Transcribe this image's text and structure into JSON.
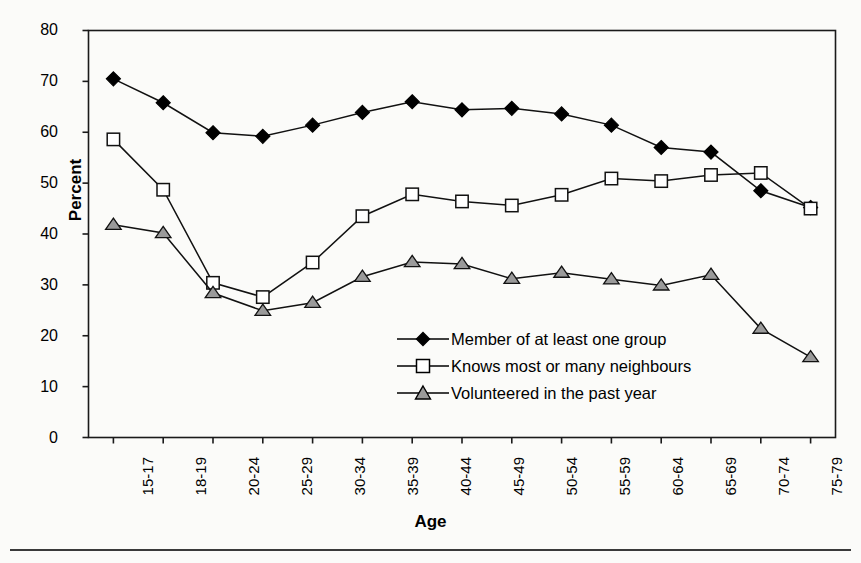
{
  "chart_data": {
    "type": "line",
    "title": "",
    "xlabel": "Age",
    "ylabel": "Percent",
    "ylim": [
      0,
      80
    ],
    "yticks": [
      0,
      10,
      20,
      30,
      40,
      50,
      60,
      70,
      80
    ],
    "grid": false,
    "legend_position": "center-right-inside",
    "categories": [
      "15-17",
      "18-19",
      "20-24",
      "25-29",
      "30-34",
      "35-39",
      "40-44",
      "45-49",
      "50-54",
      "55-59",
      "60-64",
      "65-69",
      "70-74",
      "75-79",
      "80+"
    ],
    "series": [
      {
        "name": "Member of at least one group",
        "marker": "filled-diamond",
        "color": "#000000",
        "values": [
          70.5,
          65.8,
          59.9,
          59.2,
          61.4,
          63.9,
          66.0,
          64.4,
          64.7,
          63.6,
          61.4,
          57.0,
          56.1,
          48.5,
          45.2
        ]
      },
      {
        "name": "Knows most or many neighbours",
        "marker": "open-square",
        "color": "#ffffff",
        "values": [
          58.6,
          48.7,
          30.4,
          27.6,
          34.4,
          43.5,
          47.8,
          46.4,
          45.6,
          47.7,
          50.9,
          50.4,
          51.6,
          52.0,
          45.0
        ]
      },
      {
        "name": "Volunteered in the past year",
        "marker": "grey-triangle",
        "color": "#9a9a9a",
        "values": [
          41.8,
          40.2,
          28.4,
          24.9,
          26.5,
          31.6,
          34.5,
          34.1,
          31.2,
          32.4,
          31.1,
          29.9,
          32.0,
          21.4,
          15.8
        ]
      }
    ]
  },
  "axes": {
    "y_title": "Percent",
    "x_title": "Age",
    "y_tick_labels": [
      "80",
      "70",
      "60",
      "50",
      "40",
      "30",
      "20",
      "10",
      "0"
    ],
    "x_tick_labels": [
      "15-17",
      "18-19",
      "20-24",
      "25-29",
      "30-34",
      "35-39",
      "40-44",
      "45-49",
      "50-54",
      "55-59",
      "60-64",
      "65-69",
      "70-74",
      "75-79",
      "80+"
    ]
  },
  "legend": {
    "items": [
      {
        "label": "Member of at least one group",
        "marker": "filled-diamond"
      },
      {
        "label": "Knows most or many neighbours",
        "marker": "open-square"
      },
      {
        "label": "Volunteered in the past year",
        "marker": "grey-triangle"
      }
    ]
  },
  "colors": {
    "axis": "#1a1a1a",
    "series_1": "#000000",
    "series_2_fill": "#ffffff",
    "series_3_fill": "#9a9a9a",
    "background": "#fbfbf9",
    "rule": "#3a3a3a"
  }
}
